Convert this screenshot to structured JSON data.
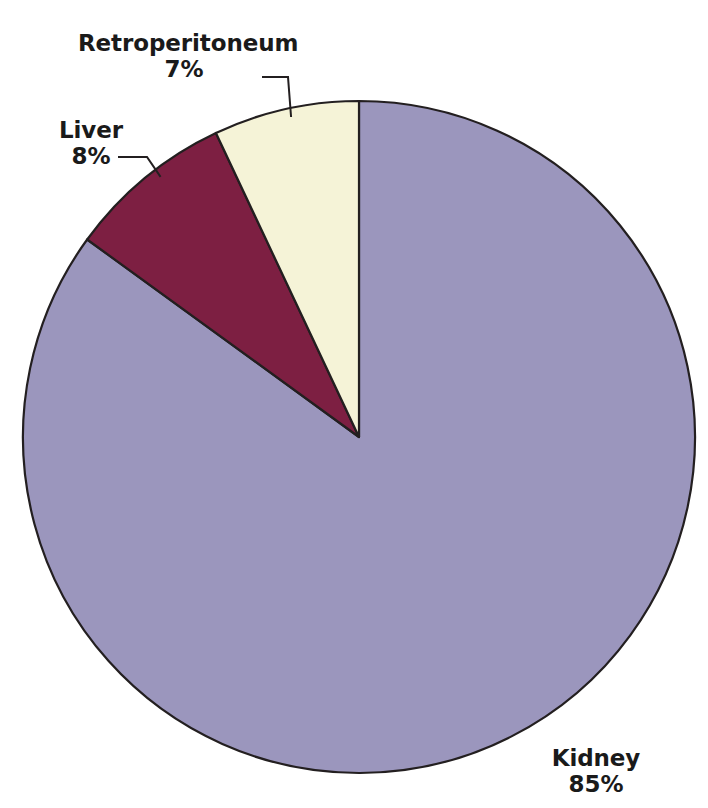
{
  "chart_data": {
    "type": "pie",
    "title": "",
    "subtitle": "",
    "xlabel": "",
    "ylabel": "",
    "legend_position": "none",
    "grid": false,
    "start_angle_deg": 0,
    "direction": "clockwise",
    "categories": [
      "Kidney",
      "Liver",
      "Retroperitoneum"
    ],
    "values": [
      85,
      8,
      7
    ],
    "value_unit": "%",
    "slices": [
      {
        "label": "Kidney",
        "value": 85,
        "value_text": "85%",
        "color": "#9b96bd",
        "start_deg": 0,
        "end_deg": 306,
        "label_placement": "outside-bottom-right",
        "has_leader_line": false
      },
      {
        "label": "Liver",
        "value": 8,
        "value_text": "8%",
        "color": "#7d1f42",
        "start_deg": 306,
        "end_deg": 334.8,
        "label_placement": "outside-upper-left",
        "has_leader_line": true
      },
      {
        "label": "Retroperitoneum",
        "value": 7,
        "value_text": "7%",
        "color": "#f5f3d7",
        "start_deg": 334.8,
        "end_deg": 360,
        "label_placement": "outside-top",
        "has_leader_line": true
      }
    ],
    "colors": {
      "kidney": "#9b96bd",
      "liver": "#7d1f42",
      "retroperitoneum": "#f5f3d7",
      "outline": "#231f20",
      "background": "#ffffff",
      "label_text": "#1a1a1a"
    },
    "geometry": {
      "center_x": 359,
      "center_y": 437,
      "radius": 336
    }
  },
  "labels": {
    "retroperitoneum": {
      "name": "Retroperitoneum",
      "value": "7%"
    },
    "liver": {
      "name": "Liver",
      "value": "8%"
    },
    "kidney": {
      "name": "Kidney",
      "value": "85%"
    }
  }
}
